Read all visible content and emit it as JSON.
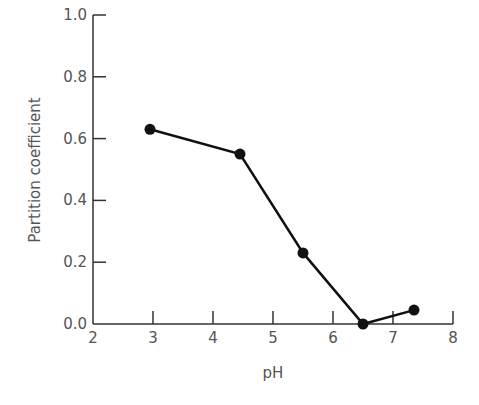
{
  "chart_data": {
    "type": "line",
    "title": "",
    "xlabel": "pH",
    "ylabel": "Partition coefficient",
    "xlim": [
      2,
      8
    ],
    "ylim": [
      0.0,
      1.0
    ],
    "xticks": [
      "2",
      "3",
      "4",
      "5",
      "6",
      "7",
      "8"
    ],
    "yticks": [
      "0.0",
      "0.2",
      "0.4",
      "0.6",
      "0.8",
      "1.0"
    ],
    "grid": false,
    "legend": null,
    "series": [
      {
        "name": "Partition coefficient",
        "x": [
          2.95,
          4.45,
          5.5,
          6.5,
          7.35
        ],
        "y": [
          0.63,
          0.55,
          0.23,
          0.0,
          0.045
        ],
        "marker": "filled-circle",
        "color": "#111111"
      }
    ]
  }
}
